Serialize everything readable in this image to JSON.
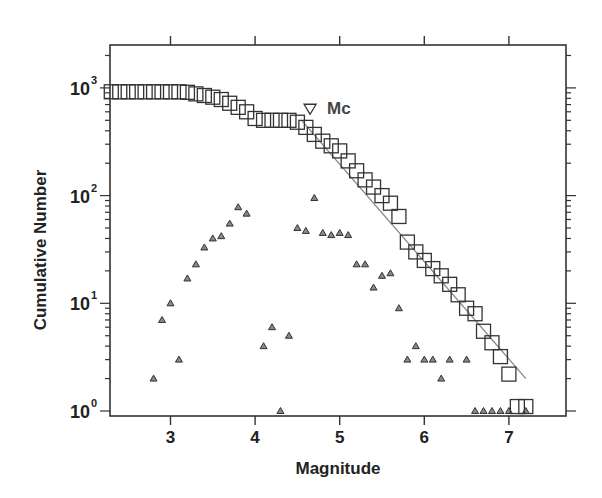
{
  "chart_data": {
    "type": "scatter",
    "title": "",
    "xlabel": "Magnitude",
    "ylabel": "Cumulative Number",
    "xlim": [
      2.25,
      7.85
    ],
    "ylim_log10": [
      -0.05,
      3.4
    ],
    "yscale": "log",
    "grid": false,
    "x_ticks": [
      3,
      4,
      5,
      6,
      7
    ],
    "x_tick_labels": [
      "3",
      "4",
      "5",
      "6",
      "7"
    ],
    "y_ticks": [
      1,
      10,
      100,
      1000
    ],
    "y_tick_labels": [
      {
        "base": "10",
        "exp": "0"
      },
      {
        "base": "10",
        "exp": "1"
      },
      {
        "base": "10",
        "exp": "2"
      },
      {
        "base": "10",
        "exp": "3"
      }
    ],
    "annotations": [
      {
        "label": "Mc",
        "x": 4.65,
        "y": 620,
        "marker": "inverted-triangle"
      }
    ],
    "series": [
      {
        "name": "Cumulative number",
        "marker": "open-square",
        "x": [
          2.3,
          2.4,
          2.5,
          2.6,
          2.7,
          2.8,
          2.9,
          3.0,
          3.1,
          3.2,
          3.3,
          3.4,
          3.5,
          3.6,
          3.7,
          3.8,
          3.9,
          4.0,
          4.1,
          4.2,
          4.3,
          4.4,
          4.5,
          4.6,
          4.7,
          4.8,
          4.9,
          5.0,
          5.1,
          5.2,
          5.3,
          5.4,
          5.5,
          5.6,
          5.7,
          5.8,
          5.9,
          6.0,
          6.1,
          6.2,
          6.3,
          6.4,
          6.5,
          6.6,
          6.7,
          6.8,
          6.9,
          7.0,
          7.1,
          7.2
        ],
        "y": [
          920,
          920,
          920,
          920,
          920,
          920,
          920,
          920,
          920,
          910,
          880,
          850,
          820,
          780,
          720,
          660,
          600,
          520,
          500,
          500,
          500,
          500,
          480,
          430,
          370,
          320,
          290,
          260,
          210,
          170,
          140,
          120,
          100,
          85,
          64,
          37,
          30,
          25,
          21,
          18,
          15,
          12,
          9,
          8,
          5.5,
          4.3,
          3.2,
          2.2,
          1.1,
          1.1
        ]
      },
      {
        "name": "Non-cumulative number",
        "marker": "triangle",
        "x": [
          2.8,
          2.9,
          3.0,
          3.1,
          3.2,
          3.3,
          3.4,
          3.5,
          3.6,
          3.7,
          3.8,
          3.9,
          4.1,
          4.2,
          4.3,
          4.4,
          4.5,
          4.6,
          4.7,
          4.8,
          4.9,
          5.0,
          5.1,
          5.2,
          5.3,
          5.4,
          5.5,
          5.6,
          5.7,
          5.8,
          5.9,
          6.0,
          6.1,
          6.2,
          6.3,
          6.5,
          6.6,
          6.7,
          6.8,
          6.9,
          7.0,
          7.2
        ],
        "y": [
          2,
          7,
          10,
          3,
          17,
          23,
          33,
          40,
          42,
          55,
          78,
          68,
          4,
          6,
          1,
          5,
          50,
          47,
          95,
          45,
          43,
          45,
          43,
          23,
          23,
          14,
          18,
          19,
          9,
          3,
          4,
          3,
          3,
          2,
          3,
          3,
          1,
          1,
          1,
          1,
          1,
          1
        ]
      },
      {
        "name": "Gutenberg-Richter fit",
        "marker": "line",
        "x": [
          4.55,
          7.2
        ],
        "y": [
          500,
          2.0
        ]
      }
    ]
  },
  "plot": {
    "frame": {
      "left": 110,
      "right": 566,
      "top": 45,
      "bottom": 416
    },
    "x_pixel_per_unit": 84.6,
    "x_origin_value": 3.0,
    "x_origin_px": 170.5,
    "y_px_at_1": 411,
    "y_px_per_decade": 107.7,
    "colors": {
      "axis": "#333333",
      "marker": "#333333",
      "fit_line": "#888888",
      "triangle_fill": "#888888"
    }
  }
}
